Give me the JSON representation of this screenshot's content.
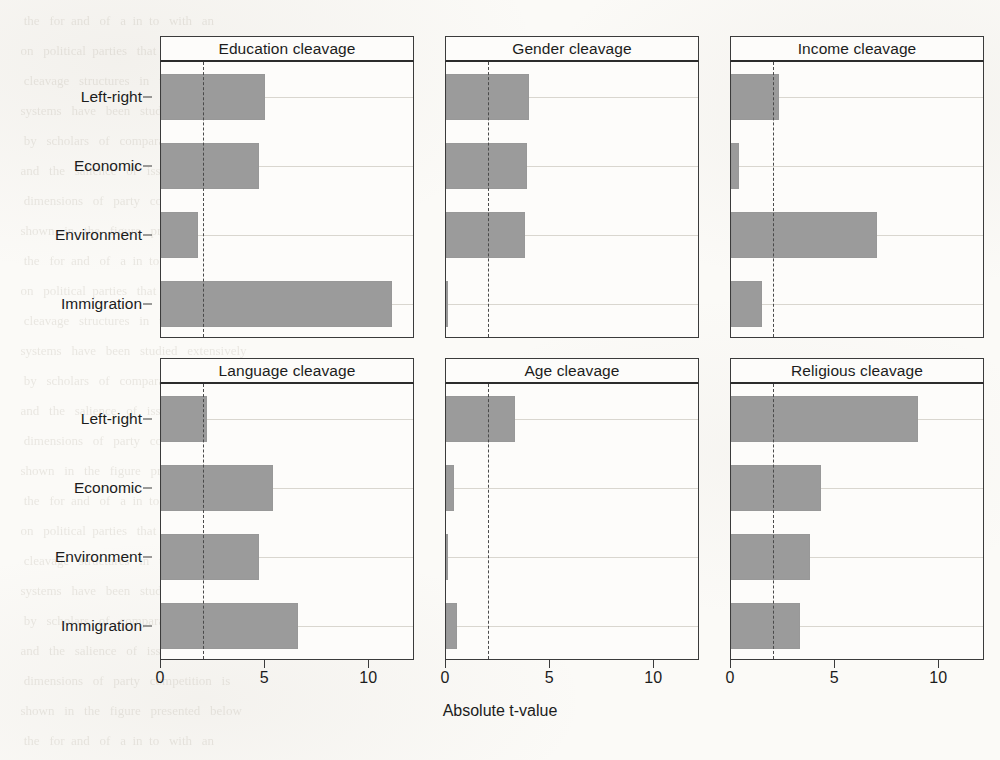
{
  "chart_data": {
    "type": "bar",
    "title": "",
    "xlabel": "Absolute t-value",
    "ylabel": "",
    "orientation": "horizontal",
    "xlim": [
      0,
      12.2
    ],
    "xticks": [
      0,
      5,
      10
    ],
    "xtick_labels": [
      "0",
      "5",
      "10"
    ],
    "grid": "horizontal",
    "legend": "none",
    "bar_color": "#9b9b9b",
    "threshold_line": {
      "value": 2.0,
      "style": "dashed",
      "color": "#4a4a4a"
    },
    "categories": [
      "Left-right",
      "Economic",
      "Environment",
      "Immigration"
    ],
    "panels": [
      {
        "title": "Education cleavage",
        "values": [
          5.0,
          4.7,
          1.8,
          11.1
        ]
      },
      {
        "title": "Gender cleavage",
        "values": [
          4.0,
          3.9,
          3.8,
          0.1
        ]
      },
      {
        "title": "Income cleavage",
        "values": [
          2.3,
          0.4,
          7.0,
          1.5
        ]
      },
      {
        "title": "Language cleavage",
        "values": [
          2.2,
          5.4,
          4.7,
          6.6
        ]
      },
      {
        "title": "Age cleavage",
        "values": [
          3.3,
          0.4,
          0.1,
          0.55
        ]
      },
      {
        "title": "Religious cleavage",
        "values": [
          9.0,
          4.3,
          3.8,
          3.3
        ]
      }
    ]
  },
  "background_bleed": {
    "lines": [
      "   the   for  and   of   a  in  to   with   an",
      "  on   political  parties   that   the   voters",
      "   cleavage   structures   in   the   European",
      "  systems   have   been   studied   extensively",
      "   by   scholars   of   comparative   politics",
      "  and   the   salience   of   issues   across",
      "   dimensions   of   party   competition   is",
      "  shown   in   the   figure   presented   below"
    ]
  }
}
